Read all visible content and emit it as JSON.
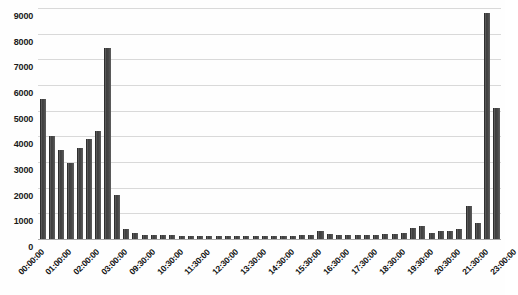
{
  "chart_data": {
    "type": "bar",
    "title": "",
    "xlabel": "",
    "ylabel": "",
    "ylim": [
      0,
      9000
    ],
    "ytick_step": 1000,
    "ytick_labels": [
      "0",
      "1000",
      "2000",
      "3000",
      "4000",
      "5000",
      "6000",
      "7000",
      "8000",
      "9000"
    ],
    "grid": true,
    "legend": "none",
    "bar_color": "#4a4a4a",
    "gridline_color": "#d9d9d9",
    "axis_color": "#a8a8a8",
    "categories": [
      "00:00:00",
      "00:30:00",
      "01:00:00",
      "01:30:00",
      "02:00:00",
      "02:30:00",
      "03:00:00",
      "03:30:00",
      "09:00:00",
      "09:30:00",
      "10:00:00",
      "10:30:00",
      "11:00:00",
      "11:30:00",
      "12:00:00",
      "12:30:00",
      "13:00:00",
      "13:30:00",
      "14:00:00",
      "14:30:00",
      "15:00:00",
      "15:30:00",
      "16:00:00",
      "16:30:00",
      "17:00:00",
      "17:30:00",
      "18:00:00",
      "18:30:00",
      "19:00:00",
      "19:30:00",
      "20:00:00",
      "20:30:00",
      "21:00:00",
      "21:30:00",
      "22:00:00",
      "22:30:00",
      "23:00:00",
      "23:30:00"
    ],
    "values": [
      5450,
      4000,
      3450,
      2950,
      3550,
      3900,
      4200,
      7450,
      1700,
      380,
      190,
      150,
      140,
      130,
      120,
      110,
      100,
      100,
      95,
      95,
      100,
      110,
      130,
      150,
      300,
      200,
      180,
      170,
      160,
      200,
      260,
      430,
      500,
      250,
      330,
      380,
      1300,
      620
    ],
    "tick_labels": [
      {
        "index": 0,
        "label": "00:00:00"
      },
      {
        "index": 3,
        "label": "01:00:00"
      },
      {
        "index": 6,
        "label": "02:00:00"
      },
      {
        "index": 9,
        "label": "03:00:00"
      },
      {
        "index": 12,
        "label": "09:30:00"
      },
      {
        "index": 15,
        "label": "10:30:00"
      },
      {
        "index": 18,
        "label": "11:30:00"
      },
      {
        "index": 21,
        "label": "12:30:00"
      },
      {
        "index": 24,
        "label": "13:30:00"
      },
      {
        "index": 27,
        "label": "14:30:00"
      },
      {
        "index": 30,
        "label": "15:30:00"
      },
      {
        "index": 33,
        "label": "16:30:00"
      },
      {
        "index": 36,
        "label": "17:30:00"
      },
      {
        "index": 39,
        "label": "18:30:00"
      },
      {
        "index": 42,
        "label": "19:30:00"
      },
      {
        "index": 45,
        "label": "20:30:00"
      },
      {
        "index": 48,
        "label": "21:30:00"
      },
      {
        "index": 51,
        "label": "23:00:00"
      }
    ],
    "series_values_full": [
      5450,
      4000,
      3450,
      2950,
      3550,
      3900,
      4200,
      7450,
      1700,
      380,
      230,
      170,
      160,
      150,
      140,
      130,
      120,
      120,
      110,
      110,
      105,
      100,
      100,
      100,
      105,
      110,
      120,
      130,
      150,
      170,
      300,
      200,
      170,
      160,
      150,
      150,
      160,
      180,
      200,
      230,
      430,
      500,
      250,
      300,
      330,
      380,
      1300,
      620,
      8800,
      5100
    ]
  }
}
